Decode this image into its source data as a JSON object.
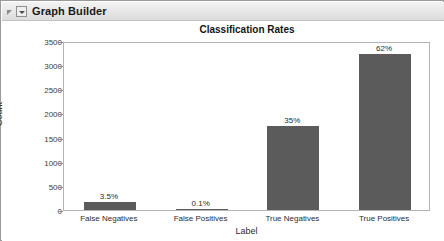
{
  "window": {
    "title": "Graph Builder",
    "disclosure_icon": "triangle-collapse-icon",
    "menu_icon": "chevron-down-icon"
  },
  "chart_data": {
    "type": "bar",
    "title": "Classification Rates",
    "xlabel": "Label",
    "ylabel": "Count",
    "categories": [
      "False Negatives",
      "False Positives",
      "True Negatives",
      "True Positives"
    ],
    "values": [
      175,
      5,
      1750,
      3230
    ],
    "data_labels": [
      "3.5%",
      "0.1%",
      "35%",
      "62%"
    ],
    "ylim": [
      0,
      3500
    ],
    "yticks": [
      0,
      500,
      1000,
      1500,
      2000,
      2500,
      3000,
      3500
    ],
    "ytick_labels": [
      "0",
      "500",
      "1000",
      "1500",
      "2000",
      "2500",
      "3000",
      "3500"
    ],
    "grid": false,
    "legend": "none",
    "bar_color": "#5b5b5b",
    "frame_color": "#b4b4b4",
    "background": "#ffffff"
  }
}
